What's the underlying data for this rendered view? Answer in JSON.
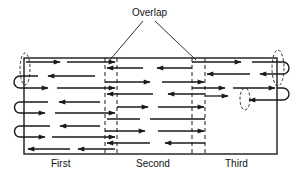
{
  "diagram": {
    "callout": "Overlap",
    "sections": [
      "First",
      "Second",
      "Third"
    ],
    "colors": {
      "ink": "#1a1a1a",
      "background": "#ffffff"
    },
    "frame": {
      "x": 24,
      "y": 58,
      "width": 253,
      "height": 96
    },
    "overlap_zones": [
      {
        "x1": 105,
        "x2": 117
      },
      {
        "x1": 192,
        "x2": 205
      }
    ],
    "passes": [
      {
        "name": "First",
        "rows": [
          {
            "y": 62,
            "dir": "right",
            "x1": 24,
            "x2": 117
          },
          {
            "y": 76,
            "dir": "left",
            "x1": 24,
            "x2": 117
          },
          {
            "y": 88,
            "dir": "right",
            "x1": 24,
            "x2": 117
          },
          {
            "y": 102,
            "dir": "left",
            "x1": 24,
            "x2": 117
          },
          {
            "y": 113,
            "dir": "right",
            "x1": 24,
            "x2": 117
          },
          {
            "y": 126,
            "dir": "left",
            "x1": 24,
            "x2": 117
          },
          {
            "y": 137,
            "dir": "right",
            "x1": 24,
            "x2": 117
          },
          {
            "y": 149,
            "dir": "left",
            "x1": 24,
            "x2": 117
          }
        ]
      },
      {
        "name": "Second",
        "rows": [
          {
            "y": 68,
            "dir": "left",
            "x1": 105,
            "x2": 205
          },
          {
            "y": 82,
            "dir": "right",
            "x1": 105,
            "x2": 205
          },
          {
            "y": 94,
            "dir": "left",
            "x1": 105,
            "x2": 205
          },
          {
            "y": 107,
            "dir": "right",
            "x1": 105,
            "x2": 205
          },
          {
            "y": 119,
            "dir": "left",
            "x1": 105,
            "x2": 205
          },
          {
            "y": 131,
            "dir": "right",
            "x1": 105,
            "x2": 205
          },
          {
            "y": 143,
            "dir": "left",
            "x1": 105,
            "x2": 205
          }
        ]
      },
      {
        "name": "Third",
        "rows": [
          {
            "y": 62,
            "dir": "right",
            "x1": 192,
            "x2": 277
          },
          {
            "y": 74,
            "dir": "left",
            "x1": 192,
            "x2": 277
          },
          {
            "y": 88,
            "dir": "right",
            "x1": 192,
            "x2": 277
          },
          {
            "y": 100,
            "dir": "left",
            "x1": 222,
            "x2": 277
          }
        ]
      }
    ]
  }
}
